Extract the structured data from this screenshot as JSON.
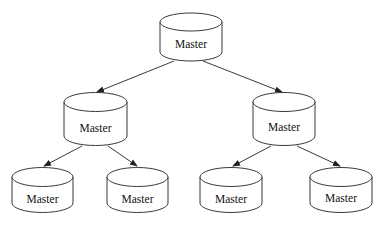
{
  "diagram": {
    "type": "tree",
    "top_cutoff_text": "··········································",
    "nodes": [
      {
        "id": "root",
        "label": "Master",
        "shape": "cylinder"
      },
      {
        "id": "mid-left",
        "label": "Master",
        "shape": "cylinder"
      },
      {
        "id": "mid-right",
        "label": "Master",
        "shape": "cylinder"
      },
      {
        "id": "leaf-1",
        "label": "Master",
        "shape": "cylinder"
      },
      {
        "id": "leaf-2",
        "label": "Master",
        "shape": "cylinder"
      },
      {
        "id": "leaf-3",
        "label": "Master",
        "shape": "cylinder"
      },
      {
        "id": "leaf-4",
        "label": "Master",
        "shape": "cylinder"
      }
    ],
    "edges": [
      {
        "from": "root",
        "to": "mid-left"
      },
      {
        "from": "root",
        "to": "mid-right"
      },
      {
        "from": "mid-left",
        "to": "leaf-1"
      },
      {
        "from": "mid-left",
        "to": "leaf-2"
      },
      {
        "from": "mid-right",
        "to": "leaf-3"
      },
      {
        "from": "mid-right",
        "to": "leaf-4"
      }
    ],
    "colors": {
      "stroke": "#222222",
      "background": "#ffffff"
    }
  }
}
